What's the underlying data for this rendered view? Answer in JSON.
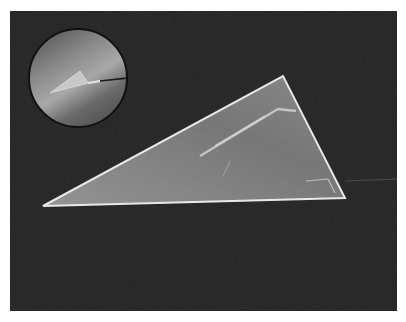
{
  "image": {
    "description": "Grayscale micrograph of a triangular tip on dark background with circular inset showing the tip at lower magnification",
    "colors": {
      "background": "#2a2a2a",
      "triangle_fill": "#8a8a8a",
      "triangle_edge": "#e6e6e6",
      "inset_fill": "#6e6e6e",
      "inset_border": "#111111",
      "page": "#ffffff"
    }
  }
}
